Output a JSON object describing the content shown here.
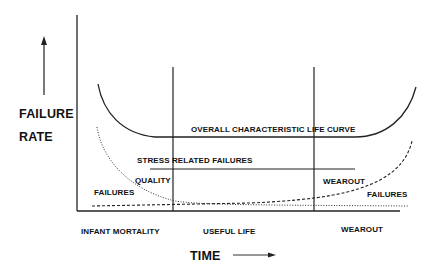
{
  "diagram": {
    "type": "bathtub-curve",
    "y_axis_label_line1": "FAILURE",
    "y_axis_label_line2": "RATE",
    "x_axis_label": "TIME",
    "curves": {
      "overall": "OVERALL CHARACTERISTIC LIFE CURVE",
      "stress": "STRESS RELATED FAILURES",
      "quality_line1": "QUALITY",
      "quality_line2": "FAILURES",
      "wearout_line1": "WEAROUT",
      "wearout_line2": "FAILURES"
    },
    "regions": [
      "INFANT MORTALITY",
      "USEFUL LIFE",
      "WEAROUT"
    ],
    "colors": {
      "ink": "#111111",
      "background": "#ffffff"
    }
  }
}
